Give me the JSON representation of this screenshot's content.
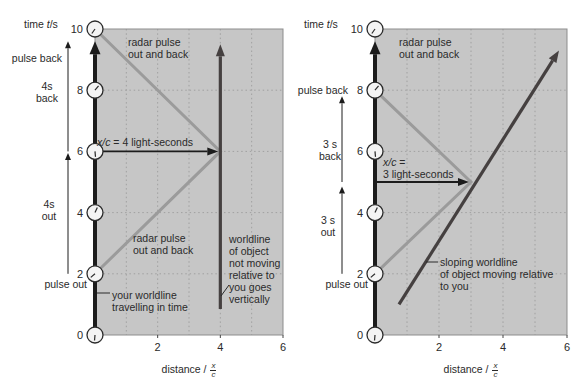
{
  "colors": {
    "plot_bg": "#c6c6c6",
    "grid": "#a0a0a0",
    "border": "#8d8d8d",
    "axis": "#1c1c1c",
    "radar": "#9b9b9b",
    "worldline": "#454040",
    "text": "#2a2a2a",
    "clock_fill": "#f4f4f4"
  },
  "panels": [
    {
      "y_axis_label": {
        "pre": "time ",
        "var": "t",
        "post": "/s"
      },
      "x_axis_label": {
        "pre": "distance / ",
        "frac_top": "x",
        "frac_bot": "c"
      },
      "labels": {
        "pulse_back": "pulse back",
        "span_back": "4s\nback",
        "span_out": "4s\nout",
        "pulse_out": "pulse out",
        "radar_top": "radar pulse\nout and back",
        "measure_var": "x/c",
        "measure_rest": " = 4 light-seconds",
        "radar_bottom": "radar pulse\nout and back",
        "worldline_note": "worldline\nof object\nnot moving\nrelative to\nyou goes\nvertically",
        "your_worldline": "your worldline\ntravelling in time"
      }
    },
    {
      "y_axis_label": {
        "pre": "time ",
        "var": "t",
        "post": "/s"
      },
      "x_axis_label": {
        "pre": "distance / ",
        "frac_top": "x",
        "frac_bot": "c"
      },
      "labels": {
        "pulse_back": "pulse back",
        "span_back": "3 s\nback",
        "span_out": "3 s\nout",
        "pulse_out": "pulse out",
        "radar_top": "radar pulse\nout and back",
        "measure_var": "x/c",
        "measure_rest": " =",
        "measure_line2": "3 light-seconds",
        "sloping_note": "sloping worldline\nof object moving relative\nto you"
      }
    }
  ],
  "chart_data": [
    {
      "type": "line",
      "xlabel": "distance / x/c",
      "ylabel": "time t/s",
      "xlim": [
        0,
        6
      ],
      "ylim": [
        0,
        10
      ],
      "x_ticks": [
        2,
        4,
        6
      ],
      "y_ticks": [
        0,
        2,
        4,
        6,
        8,
        10
      ],
      "grid_x": [
        1,
        2,
        3,
        4,
        5
      ],
      "grid_y": [
        2,
        4,
        6,
        8
      ],
      "clocks": [
        0,
        2,
        4,
        6,
        8,
        10
      ],
      "series": [
        {
          "name": "your worldline travelling in time",
          "role": "observer-axis",
          "points": [
            [
              0,
              0
            ],
            [
              0,
              9.6
            ]
          ],
          "arrow": true
        },
        {
          "name": "radar pulse out and back",
          "role": "radar",
          "points": [
            [
              0,
              2
            ],
            [
              4,
              6
            ],
            [
              0,
              10
            ]
          ],
          "arrow": false
        },
        {
          "name": "worldline of object not moving relative to you",
          "role": "object-worldline",
          "points": [
            [
              4,
              0.85
            ],
            [
              4,
              9.5
            ]
          ],
          "arrow": true
        }
      ],
      "measure_arrow": {
        "t": 6,
        "x_from": 0,
        "x_to": 4,
        "value": "4 light-seconds"
      },
      "margin_arrows": [
        {
          "t_from": 6,
          "t_to": 9.6,
          "label": "4s back"
        },
        {
          "t_from": 2,
          "t_to": 5.95,
          "label": "4s out"
        }
      ]
    },
    {
      "type": "line",
      "xlabel": "distance / x/c",
      "ylabel": "time t/s",
      "xlim": [
        0,
        6
      ],
      "ylim": [
        0,
        10
      ],
      "x_ticks": [
        2,
        4,
        6
      ],
      "y_ticks": [
        0,
        2,
        4,
        6,
        8,
        10
      ],
      "grid_x": [
        1,
        2,
        3,
        4,
        5
      ],
      "grid_y": [
        2,
        4,
        6,
        8
      ],
      "clocks": [
        0,
        2,
        4,
        6,
        8,
        10
      ],
      "series": [
        {
          "name": "your worldline travelling in time",
          "role": "observer-axis",
          "points": [
            [
              0,
              0
            ],
            [
              0,
              9.6
            ]
          ],
          "arrow": true
        },
        {
          "name": "radar pulse out and back",
          "role": "radar",
          "points": [
            [
              0,
              2
            ],
            [
              3,
              5
            ],
            [
              0,
              8
            ]
          ],
          "arrow": false
        },
        {
          "name": "sloping worldline of object moving relative to you",
          "role": "object-worldline",
          "points": [
            [
              0.75,
              1.0
            ],
            [
              5.75,
              9.3
            ]
          ],
          "arrow": true
        }
      ],
      "measure_arrow": {
        "t": 5,
        "x_from": 0,
        "x_to": 3,
        "value": "3 light-seconds"
      },
      "margin_arrows": [
        {
          "t_from": 5,
          "t_to": 7.8,
          "label": "3 s back"
        },
        {
          "t_from": 2,
          "t_to": 4.85,
          "label": "3 s out"
        }
      ]
    }
  ]
}
